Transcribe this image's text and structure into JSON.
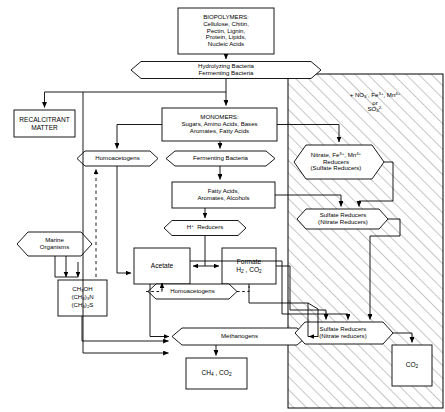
{
  "diagram": {
    "nodes": {
      "biopolymers": {
        "label": "BIOPOLYMERS:\nCellulose, Chitin,\nPectin, Lignin,\nProtein,  Lipids,\nNucleic Acids",
        "shape": "box"
      },
      "hydrolyzing": {
        "label": "Hydrolyzing Bacteria\nFermenting Bacteria",
        "shape": "hexagon"
      },
      "recalcitrant": {
        "label": "RECALCITRANT\nMATTER",
        "shape": "box"
      },
      "monomers": {
        "label": "MONOMERS:\nSugars, Amino Acids, Bases\nAromates, Fatty Acids",
        "shape": "box"
      },
      "homoacetogens_top": {
        "label": "Homoacetogens",
        "shape": "hexagon"
      },
      "fermenting_bacteria": {
        "label": "Fermenting Bacteria",
        "shape": "hexagon"
      },
      "fatty_acids": {
        "label": "Fatty Acids,\nAromates, Alcohols",
        "shape": "box"
      },
      "h_reducers": {
        "label": "H+ Reducers",
        "shape": "hexagon"
      },
      "marine_organisms": {
        "label": "Marine\nOrganisms",
        "shape": "hexagon"
      },
      "acetate": {
        "label": "Acetate",
        "shape": "box"
      },
      "formate": {
        "label": "Formate\nH2 , CO2",
        "shape": "box"
      },
      "homoacetogens_mid": {
        "label": "Homoacetogens",
        "shape": "hexagon"
      },
      "methyl_compounds": {
        "label": "CH3OH\n(CH3)3N\n(CH3)2S",
        "shape": "box"
      },
      "methanogens": {
        "label": "Methanogens",
        "shape": "hexagon"
      },
      "methane_co2": {
        "label": "CH4 , CO2",
        "shape": "box"
      },
      "nitrate_reducers": {
        "label": "Nitrate, Fe3+, Mn4+\nReducers\n(Sulfate Reducers)",
        "shape": "hexagon"
      },
      "sulfate_reducers_upper": {
        "label": "Sulfate Reducers\n(Nitrate Reducers)",
        "shape": "hexagon"
      },
      "sulfate_reducers_lower": {
        "label": "Sulfate Reducers\n(Nitrate reducers)",
        "shape": "hexagon"
      },
      "co2_box": {
        "label": "CO2",
        "shape": "box"
      },
      "electron_acceptors": {
        "label": "+ NO3- , Fe3+ , Mn4+\nor\nSO4 2-",
        "shape": "free-text"
      }
    },
    "style": {
      "line_color": "#000000",
      "background": "#ffffff",
      "hatch_color": "#9a9a9a",
      "hatch_region_label": "hatched-anoxic-zone"
    }
  }
}
